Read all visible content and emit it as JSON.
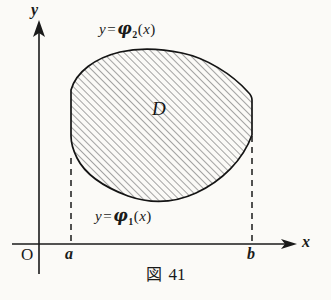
{
  "figure": {
    "caption_symbol": "図",
    "caption_number": "41",
    "region_label": "D",
    "axes": {
      "y_label": "y",
      "x_label": "x",
      "origin_label": "O",
      "left_bound_label": "a",
      "right_bound_label": "b"
    },
    "curves": {
      "upper": {
        "lhs": "y",
        "equals": "=",
        "func": "φ",
        "subscript": "2",
        "open_paren": "(",
        "arg": "x",
        "close_paren": ")"
      },
      "lower": {
        "lhs": "y",
        "equals": "=",
        "func": "φ",
        "subscript": "1",
        "open_paren": "(",
        "arg": "x",
        "close_paren": ")"
      }
    },
    "colors": {
      "background": "#fbfaf7",
      "ink": "#1a1a1a",
      "hatch": "#8a8a8a",
      "outline": "#111111"
    }
  }
}
